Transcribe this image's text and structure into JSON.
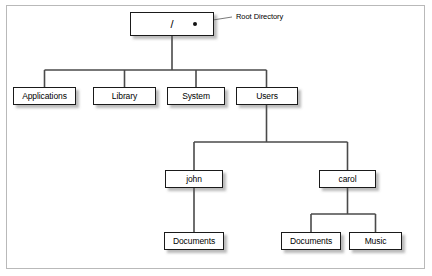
{
  "diagram": {
    "frame": {
      "border_color": "#b9b9b9",
      "background": "#ffffff"
    },
    "style": {
      "node_border_color": "#1a1a1a",
      "node_fill": "#ffffff",
      "connector_color": "#4a4a4a",
      "shadow_color": "#8a8a8a",
      "text_color": "#000000"
    },
    "annotation": {
      "label": "Root Directory",
      "marker": "root-dot"
    },
    "nodes": [
      {
        "id": "root",
        "label": "/",
        "level": 0,
        "x": 130,
        "y": 12,
        "w": 84,
        "h": 24
      },
      {
        "id": "applications",
        "label": "Applications",
        "level": 1,
        "x": 13,
        "y": 87,
        "w": 63,
        "h": 18
      },
      {
        "id": "library",
        "label": "Library",
        "level": 1,
        "x": 93,
        "y": 87,
        "w": 63,
        "h": 18
      },
      {
        "id": "system",
        "label": "System",
        "level": 1,
        "x": 167,
        "y": 87,
        "w": 58,
        "h": 18
      },
      {
        "id": "users",
        "label": "Users",
        "level": 1,
        "x": 236,
        "y": 87,
        "w": 62,
        "h": 18
      },
      {
        "id": "john",
        "label": "john",
        "level": 2,
        "x": 165,
        "y": 170,
        "w": 58,
        "h": 18
      },
      {
        "id": "carol",
        "label": "carol",
        "level": 2,
        "x": 319,
        "y": 170,
        "w": 57,
        "h": 18
      },
      {
        "id": "john-docs",
        "label": "Documents",
        "level": 3,
        "x": 164,
        "y": 232,
        "w": 60,
        "h": 18
      },
      {
        "id": "carol-docs",
        "label": "Documents",
        "level": 3,
        "x": 281,
        "y": 232,
        "w": 60,
        "h": 18
      },
      {
        "id": "carol-music",
        "label": "Music",
        "level": 3,
        "x": 349,
        "y": 232,
        "w": 53,
        "h": 18
      }
    ],
    "edges": [
      {
        "from": "root",
        "to": "applications"
      },
      {
        "from": "root",
        "to": "library"
      },
      {
        "from": "root",
        "to": "system"
      },
      {
        "from": "root",
        "to": "users"
      },
      {
        "from": "users",
        "to": "john"
      },
      {
        "from": "users",
        "to": "carol"
      },
      {
        "from": "john",
        "to": "john-docs"
      },
      {
        "from": "carol",
        "to": "carol-docs"
      },
      {
        "from": "carol",
        "to": "carol-music"
      }
    ]
  }
}
